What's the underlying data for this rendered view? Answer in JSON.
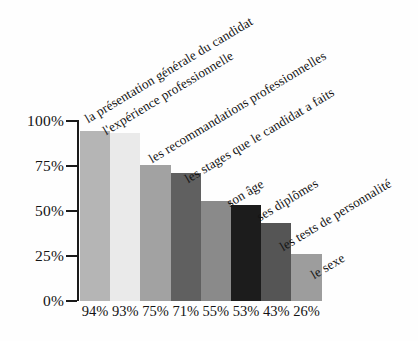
{
  "chart_data": {
    "type": "bar",
    "title": "",
    "subtitle": "",
    "xlabel": "",
    "ylabel": "",
    "ylim": [
      0,
      100
    ],
    "grid": false,
    "legend_position": "none",
    "axis_ticks": [
      "0%",
      "25%",
      "50%",
      "75%",
      "100%"
    ],
    "axis_tick_values": [
      0,
      25,
      50,
      75,
      100
    ],
    "categories": [
      "la présentation générale du candidat",
      "l'expérience professionnelle",
      "les recommandations professionnelles",
      "les stages que le candidat a faits",
      "son âge",
      "ses diplômes",
      "les tests de personnalité",
      "le sexe"
    ],
    "values": [
      94,
      93,
      75,
      71,
      55,
      53,
      43,
      26
    ],
    "value_labels": [
      "94%",
      "93%",
      "75%",
      "71%",
      "55%",
      "53%",
      "43%",
      "26%"
    ],
    "bar_colors": [
      "#b5b5b5",
      "#eaeaea",
      "#a2a2a2",
      "#606060",
      "#8a8a8a",
      "#1c1c1c",
      "#555555",
      "#9d9d9d"
    ],
    "axis_color": "#1a1a1a",
    "background_color": "#fefefe",
    "text_color": "#131313"
  }
}
